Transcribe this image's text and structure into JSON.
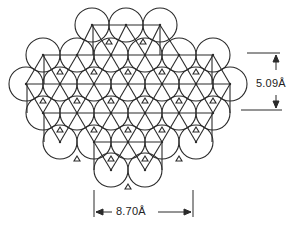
{
  "figure": {
    "stroke_color": "#2a2a2a",
    "background": "#ffffff",
    "circle_radius": 17,
    "circles": [
      [
        92,
        25
      ],
      [
        126,
        25
      ],
      [
        160,
        25
      ],
      [
        43,
        55
      ],
      [
        77,
        55
      ],
      [
        111,
        55
      ],
      [
        145,
        55
      ],
      [
        179,
        55
      ],
      [
        213,
        55
      ],
      [
        26,
        84
      ],
      [
        60,
        84
      ],
      [
        94,
        84
      ],
      [
        128,
        84
      ],
      [
        162,
        84
      ],
      [
        196,
        84
      ],
      [
        230,
        84
      ],
      [
        43,
        113
      ],
      [
        77,
        113
      ],
      [
        111,
        113
      ],
      [
        145,
        113
      ],
      [
        179,
        113
      ],
      [
        213,
        113
      ],
      [
        60,
        142
      ],
      [
        94,
        142
      ],
      [
        128,
        142
      ],
      [
        162,
        142
      ],
      [
        196,
        142
      ],
      [
        111,
        170
      ],
      [
        145,
        170
      ]
    ],
    "horizontal_lines": [
      [
        93,
        25,
        160,
        25
      ],
      [
        44,
        55,
        212,
        55
      ],
      [
        27,
        84,
        230,
        84
      ],
      [
        44,
        113,
        212,
        113
      ],
      [
        94,
        142,
        162,
        142
      ]
    ],
    "vertical_lines": [
      [
        93,
        25,
        93,
        55
      ],
      [
        160,
        25,
        160,
        55
      ],
      [
        44,
        55,
        44,
        84
      ],
      [
        212,
        55,
        212,
        84
      ],
      [
        27,
        84,
        27,
        113
      ],
      [
        230,
        84,
        230,
        113
      ],
      [
        44,
        113,
        44,
        142
      ],
      [
        212,
        113,
        212,
        142
      ],
      [
        94,
        142,
        94,
        170
      ],
      [
        162,
        142,
        162,
        170
      ]
    ]
  },
  "annotations": {
    "vertical_dimension": "5.09Å",
    "horizontal_dimension": "8.70Å"
  }
}
